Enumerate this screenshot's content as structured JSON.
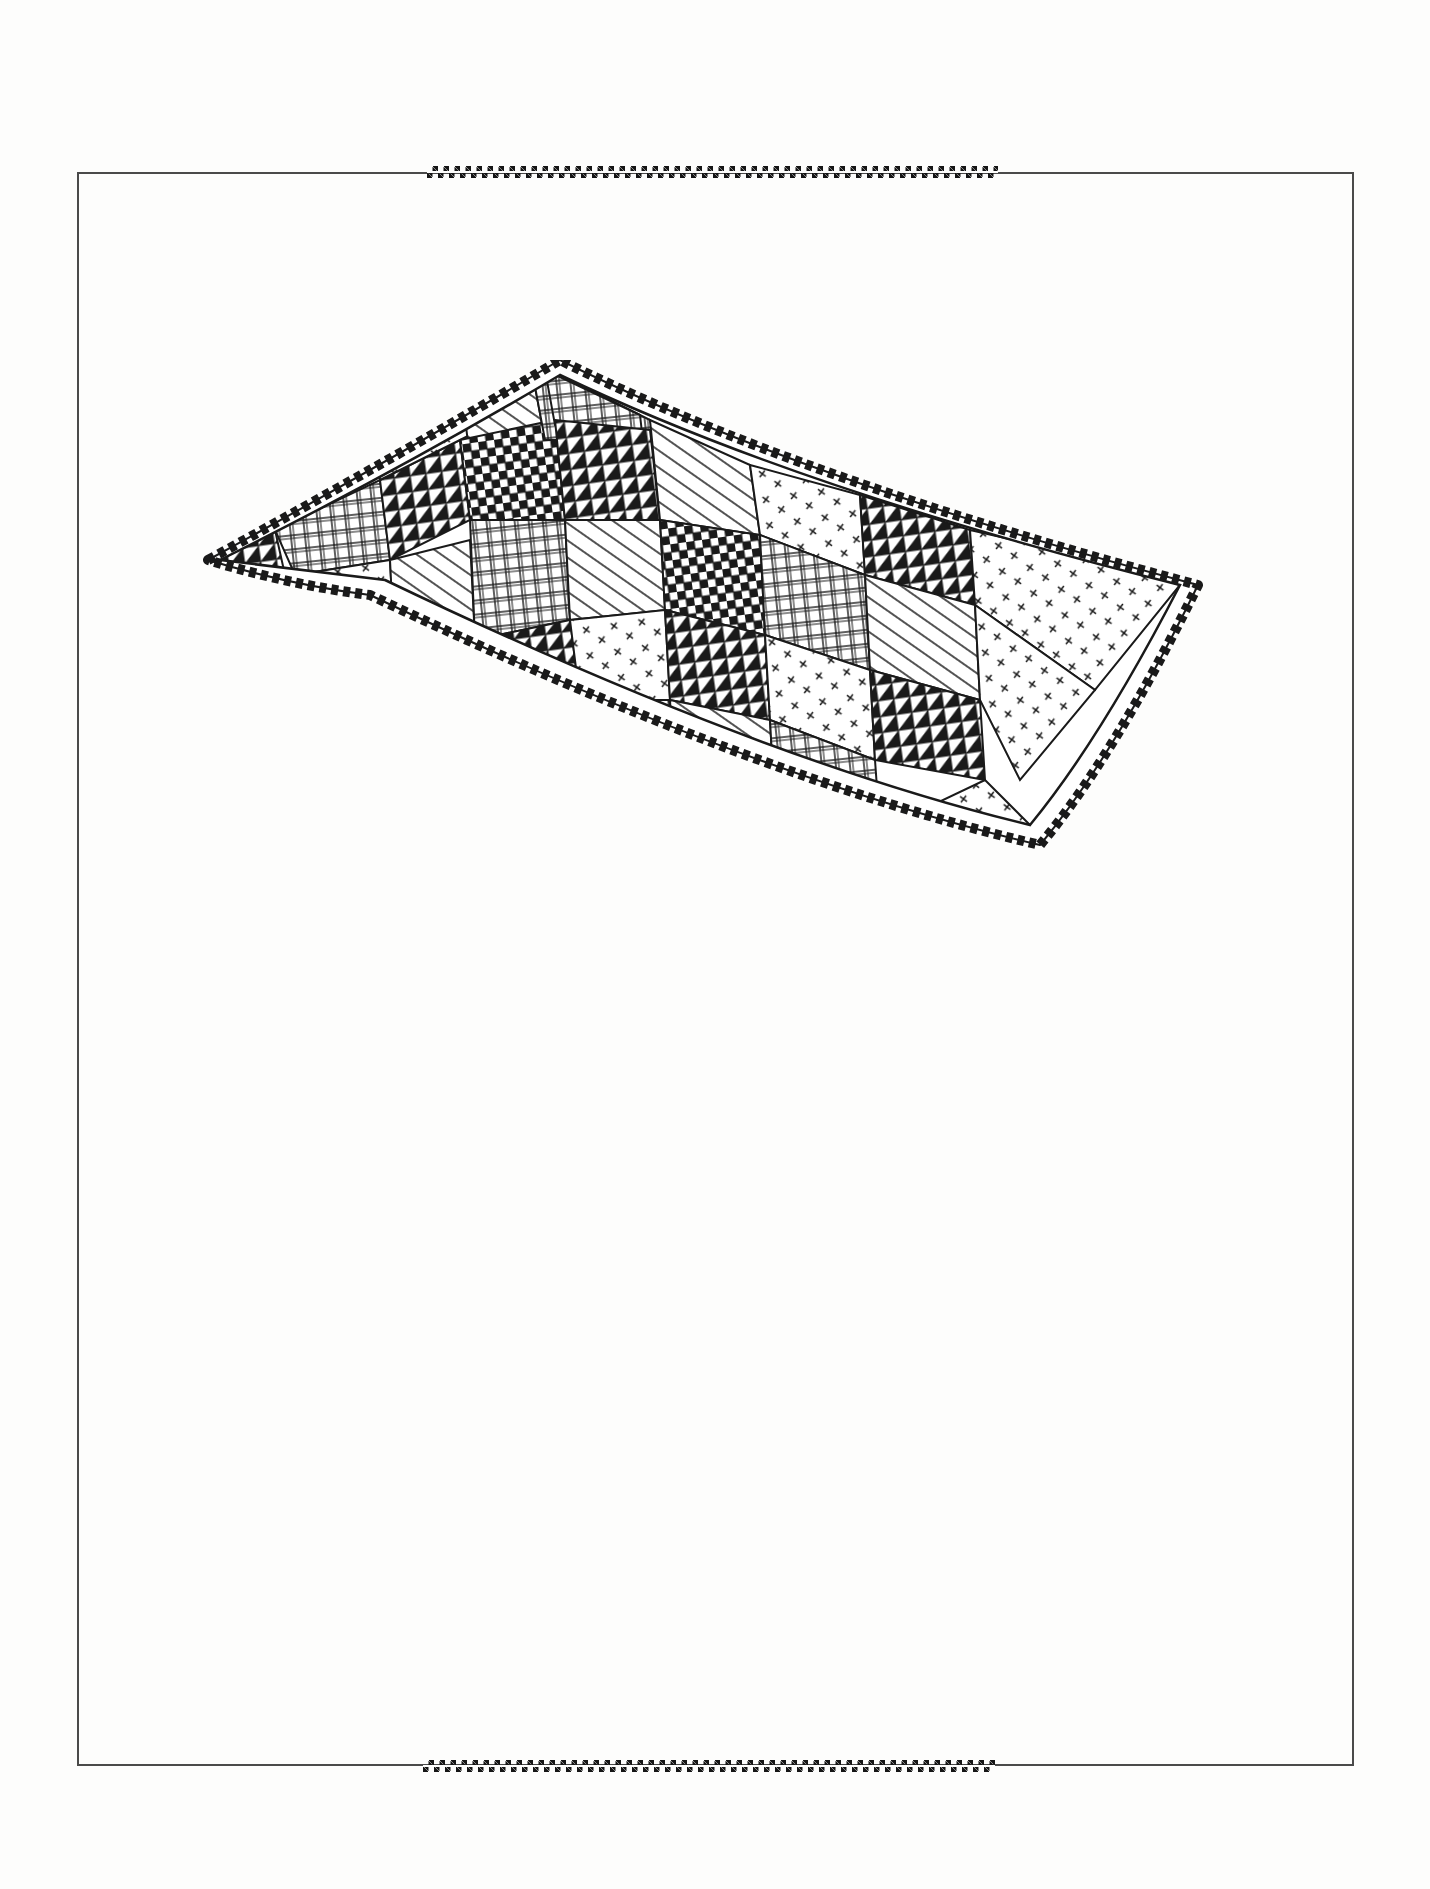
{
  "page": {
    "background": "#fdfdfc",
    "ink": "#151515",
    "frame_color": "#4a4a4a"
  },
  "frame": {
    "x": 77,
    "y": 172,
    "width": 1277,
    "height": 1594
  },
  "ornaments": {
    "top_strip": {
      "pattern": "checker",
      "x": 427,
      "width": 571
    },
    "bottom_strip": {
      "pattern": "checker",
      "x": 423,
      "width": 572
    }
  },
  "illustration": {
    "subject": "ruffled patchwork quilt pillow",
    "style": "pen-and-ink line drawing",
    "patterns": [
      "nine-patch checkerboard",
      "plaid grid",
      "diagonal stripes",
      "half-square triangles",
      "x-stitch dots"
    ],
    "border": "ruffle"
  }
}
